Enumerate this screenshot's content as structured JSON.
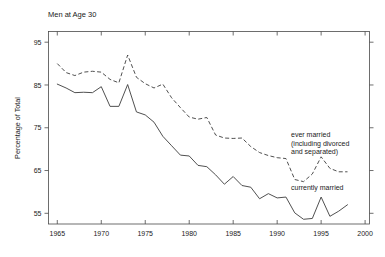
{
  "chart_data": {
    "type": "line",
    "title": "Men at Age 30",
    "xlabel": "",
    "ylabel": "Percentage of Total",
    "xlim": [
      1964,
      2000.5
    ],
    "ylim": [
      52.5,
      97.5
    ],
    "grid": false,
    "legend_position": "inline-annotations",
    "x_ticks": [
      1965,
      1970,
      1975,
      1980,
      1985,
      1990,
      1995,
      2000
    ],
    "x_tick_labels": [
      "1965",
      "1970",
      "1975",
      "1980",
      "1985",
      "1990",
      "1995",
      "2000"
    ],
    "y_ticks": [
      55,
      65,
      75,
      85,
      95
    ],
    "y_tick_labels": [
      "55",
      "65",
      "75",
      "85",
      "95"
    ],
    "x": [
      1965,
      1966,
      1967,
      1968,
      1969,
      1970,
      1971,
      1972,
      1973,
      1974,
      1975,
      1976,
      1977,
      1978,
      1979,
      1980,
      1981,
      1982,
      1983,
      1984,
      1985,
      1986,
      1987,
      1988,
      1989,
      1990,
      1991,
      1992,
      1993,
      1994,
      1995,
      1996,
      1997,
      1998
    ],
    "series": [
      {
        "name": "ever married (including divorced and separated)",
        "style": "dashed",
        "values": [
          90.0,
          87.9,
          87.2,
          88.0,
          88.2,
          88.0,
          86.3,
          85.5,
          92.0,
          86.8,
          85.3,
          84.3,
          85.2,
          82.0,
          79.7,
          77.5,
          77.0,
          77.4,
          73.3,
          72.6,
          72.5,
          72.6,
          70.6,
          69.2,
          68.5,
          68.0,
          67.8,
          62.9,
          62.4,
          64.2,
          68.2,
          65.5,
          64.7,
          64.7
        ]
      },
      {
        "name": "currently married",
        "style": "solid",
        "values": [
          85.2,
          84.3,
          83.2,
          83.3,
          83.2,
          84.6,
          80.0,
          80.0,
          85.1,
          78.7,
          78.0,
          76.3,
          73.0,
          70.8,
          68.6,
          68.4,
          66.2,
          65.9,
          64.0,
          61.8,
          63.6,
          61.5,
          61.1,
          58.4,
          59.6,
          58.6,
          58.8,
          55.1,
          53.6,
          53.8,
          58.8,
          54.3,
          55.5,
          57.0
        ]
      }
    ],
    "annotations": [
      {
        "id": "ever-married-label",
        "lines": [
          "ever married",
          "(including divorced",
          "and separated)"
        ],
        "x": 291,
        "y": 137
      },
      {
        "id": "currently-married-label",
        "lines": [
          "currently married"
        ],
        "x": 291,
        "y": 190
      }
    ],
    "colors": {
      "line": "#3c3c3c",
      "axis": "#4a4a4a",
      "text": "#1a1a1a",
      "background": "#ffffff"
    }
  }
}
